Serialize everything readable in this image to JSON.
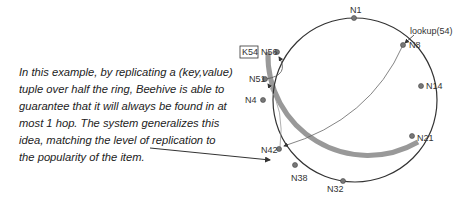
{
  "caption": "In this example, by replicating a (key,value) tuple over half the ring, Beehive is able to guarantee that it will always be found in at most 1 hop.  The system generalizes this idea, matching the level of replication to the popularity of the item.",
  "ring": {
    "nodes": [
      {
        "id": "N1",
        "label": "N1"
      },
      {
        "id": "N8",
        "label": "N8"
      },
      {
        "id": "N14",
        "label": "N14"
      },
      {
        "id": "N21",
        "label": "N21"
      },
      {
        "id": "N32",
        "label": "N32"
      },
      {
        "id": "N38",
        "label": "N38"
      },
      {
        "id": "N42",
        "label": "N42"
      },
      {
        "id": "N4",
        "label": "N4"
      },
      {
        "id": "N51",
        "label": "N51"
      },
      {
        "id": "N56",
        "label": "N56"
      }
    ],
    "key_label": "K54",
    "lookup_label": "lookup(54)"
  },
  "colors": {
    "ring": "#333333",
    "replication_arc": "#999999",
    "node_fill": "#777777"
  }
}
